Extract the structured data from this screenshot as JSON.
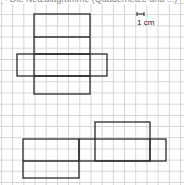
{
  "caption": "▪ Die Netzdiagramme (Quadernetze und ...)",
  "scale_label": "1 cm",
  "colors": {
    "line": "#2a2a2a",
    "grid": "#d4d4d4"
  },
  "nets": [
    {
      "name": "net-1",
      "rects": [
        [
          34,
          14,
          56,
          80
        ],
        [
          17,
          54,
          90,
          22
        ]
      ],
      "lines": [
        [
          34,
          37,
          90,
          37
        ],
        [
          34,
          54,
          90,
          54
        ],
        [
          34,
          76,
          90,
          76
        ]
      ]
    },
    {
      "name": "net-2",
      "rects": [
        [
          23,
          139,
          56,
          39
        ],
        [
          79,
          139,
          87,
          22
        ],
        [
          95,
          122,
          55,
          39
        ]
      ],
      "lines": [
        [
          23,
          161,
          79,
          161
        ],
        [
          150,
          139,
          150,
          161
        ]
      ]
    }
  ]
}
